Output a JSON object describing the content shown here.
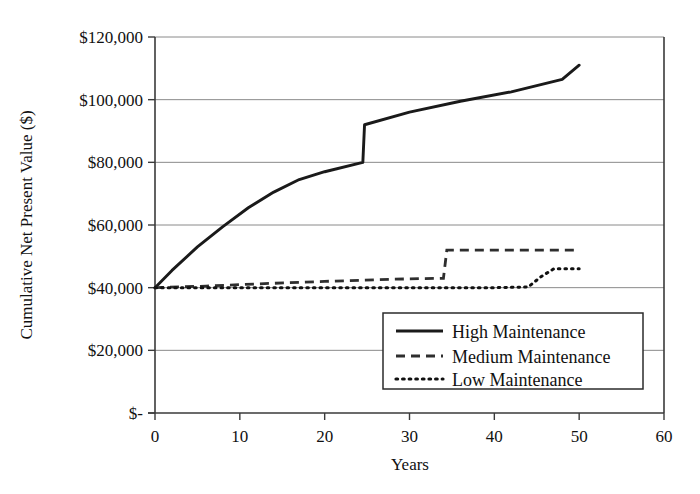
{
  "chart_data": {
    "type": "line",
    "title": "",
    "xlabel": "Years",
    "ylabel": "Cumulative Net Present Value ($)",
    "xlim": [
      0,
      60
    ],
    "ylim": [
      0,
      120000
    ],
    "grid": true,
    "legend_position": "lower-right-inside",
    "xticks": [
      0,
      10,
      20,
      30,
      40,
      50,
      60
    ],
    "xtick_labels": [
      "0",
      "10",
      "20",
      "30",
      "40",
      "50",
      "60"
    ],
    "yticks": [
      0,
      20000,
      40000,
      60000,
      80000,
      100000,
      120000
    ],
    "ytick_labels": [
      "$-",
      "$20,000",
      "$40,000",
      "$60,000",
      "$80,000",
      "$100,000",
      "$120,000"
    ],
    "series": [
      {
        "name": "High Maintenance",
        "style": "solid",
        "color": "#1a1a1a",
        "x": [
          0,
          2,
          5,
          8,
          11,
          14,
          17,
          20,
          24.5,
          24.7,
          30,
          36,
          42,
          48,
          50
        ],
        "values": [
          40000,
          45500,
          53000,
          59500,
          65500,
          70500,
          74500,
          77000,
          80000,
          92000,
          96000,
          99500,
          102500,
          106500,
          111000
        ]
      },
      {
        "name": "Medium Maintenance",
        "style": "dashed",
        "color": "#2e2e2e",
        "x": [
          0,
          6,
          12,
          20,
          28,
          34,
          34.4,
          40,
          50
        ],
        "values": [
          40000,
          40500,
          41200,
          42000,
          42700,
          43000,
          52000,
          52000,
          52000
        ]
      },
      {
        "name": "Low Maintenance",
        "style": "dotted",
        "color": "#111111",
        "x": [
          0,
          10,
          20,
          30,
          40,
          44,
          45.5,
          47,
          50
        ],
        "values": [
          40000,
          40000,
          40000,
          40000,
          40000,
          40200,
          43500,
          46000,
          46000
        ]
      }
    ]
  },
  "legend": {
    "items": [
      {
        "label": "High Maintenance",
        "style": "solid"
      },
      {
        "label": "Medium Maintenance",
        "style": "dashed"
      },
      {
        "label": "Low Maintenance",
        "style": "dotted"
      }
    ]
  }
}
